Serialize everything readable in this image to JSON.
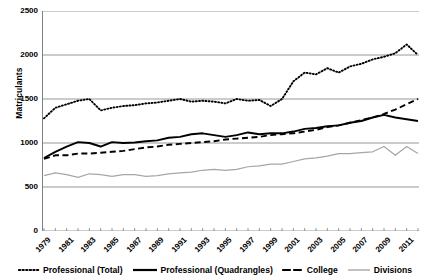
{
  "chart_data": {
    "type": "line",
    "title": "",
    "xlabel": "",
    "ylabel": "Matriculants",
    "ylim": [
      0,
      2500
    ],
    "ytick_values": [
      2500,
      2000,
      1500,
      1000,
      500,
      0
    ],
    "ytick_labels": [
      "2500",
      "2000",
      "1500",
      "1000",
      "500",
      "0"
    ],
    "grid": "horizontal",
    "legend_position": "bottom",
    "x": [
      1979,
      1980,
      1981,
      1982,
      1983,
      1984,
      1985,
      1986,
      1987,
      1988,
      1989,
      1990,
      1991,
      1992,
      1993,
      1994,
      1995,
      1996,
      1997,
      1998,
      1999,
      2000,
      2001,
      2002,
      2003,
      2004,
      2005,
      2006,
      2007,
      2008,
      2009,
      2010,
      2011,
      2012
    ],
    "xtick_labels": [
      "1979",
      "1981",
      "1983",
      "1985",
      "1987",
      "1989",
      "1991",
      "1993",
      "1995",
      "1997",
      "1999",
      "2001",
      "2003",
      "2005",
      "2007",
      "2009",
      "2011"
    ],
    "series": [
      {
        "name": "Professional (Total)",
        "style": "dotted",
        "color": "#000000",
        "values": [
          1280,
          1400,
          1440,
          1480,
          1500,
          1370,
          1400,
          1420,
          1430,
          1450,
          1460,
          1480,
          1500,
          1470,
          1480,
          1470,
          1450,
          1500,
          1480,
          1490,
          1420,
          1500,
          1700,
          1800,
          1780,
          1850,
          1800,
          1870,
          1900,
          1950,
          1980,
          2020,
          2120,
          2000
        ]
      },
      {
        "name": "Professional (Quadrangles)",
        "style": "solid",
        "color": "#000000",
        "values": [
          830,
          900,
          960,
          1010,
          1000,
          960,
          1010,
          1000,
          1005,
          1020,
          1030,
          1060,
          1070,
          1100,
          1110,
          1090,
          1070,
          1090,
          1120,
          1100,
          1110,
          1110,
          1130,
          1160,
          1170,
          1190,
          1200,
          1230,
          1250,
          1290,
          1320,
          1290,
          1270,
          1250
        ]
      },
      {
        "name": "College",
        "style": "dashed",
        "color": "#000000",
        "values": [
          820,
          860,
          860,
          880,
          880,
          890,
          900,
          910,
          930,
          950,
          960,
          980,
          990,
          1000,
          1010,
          1020,
          1040,
          1050,
          1060,
          1070,
          1090,
          1100,
          1110,
          1130,
          1150,
          1180,
          1200,
          1230,
          1260,
          1290,
          1330,
          1380,
          1440,
          1500
        ]
      },
      {
        "name": "Divisions",
        "style": "solid-gray",
        "color": "#a6a6a6",
        "values": [
          630,
          660,
          640,
          610,
          650,
          640,
          620,
          640,
          640,
          620,
          630,
          650,
          660,
          670,
          690,
          700,
          690,
          700,
          730,
          740,
          760,
          760,
          790,
          820,
          830,
          850,
          880,
          880,
          890,
          900,
          960,
          860,
          960,
          880
        ]
      }
    ]
  },
  "legend": {
    "items": [
      {
        "label": "Professional (Total)",
        "marker": "dotted-line-swatch"
      },
      {
        "label": "Professional (Quadrangles)",
        "marker": "solid-line-swatch"
      },
      {
        "label": "College",
        "marker": "dashed-line-swatch"
      },
      {
        "label": "Divisions",
        "marker": "gray-line-swatch"
      }
    ]
  },
  "axes": {
    "y_title": "Matriculants"
  },
  "colors": {
    "axis": "#7f7f7f",
    "gridline": "#7f7f7f",
    "series_black": "#000000",
    "series_gray": "#a6a6a6",
    "background": "#ffffff"
  }
}
